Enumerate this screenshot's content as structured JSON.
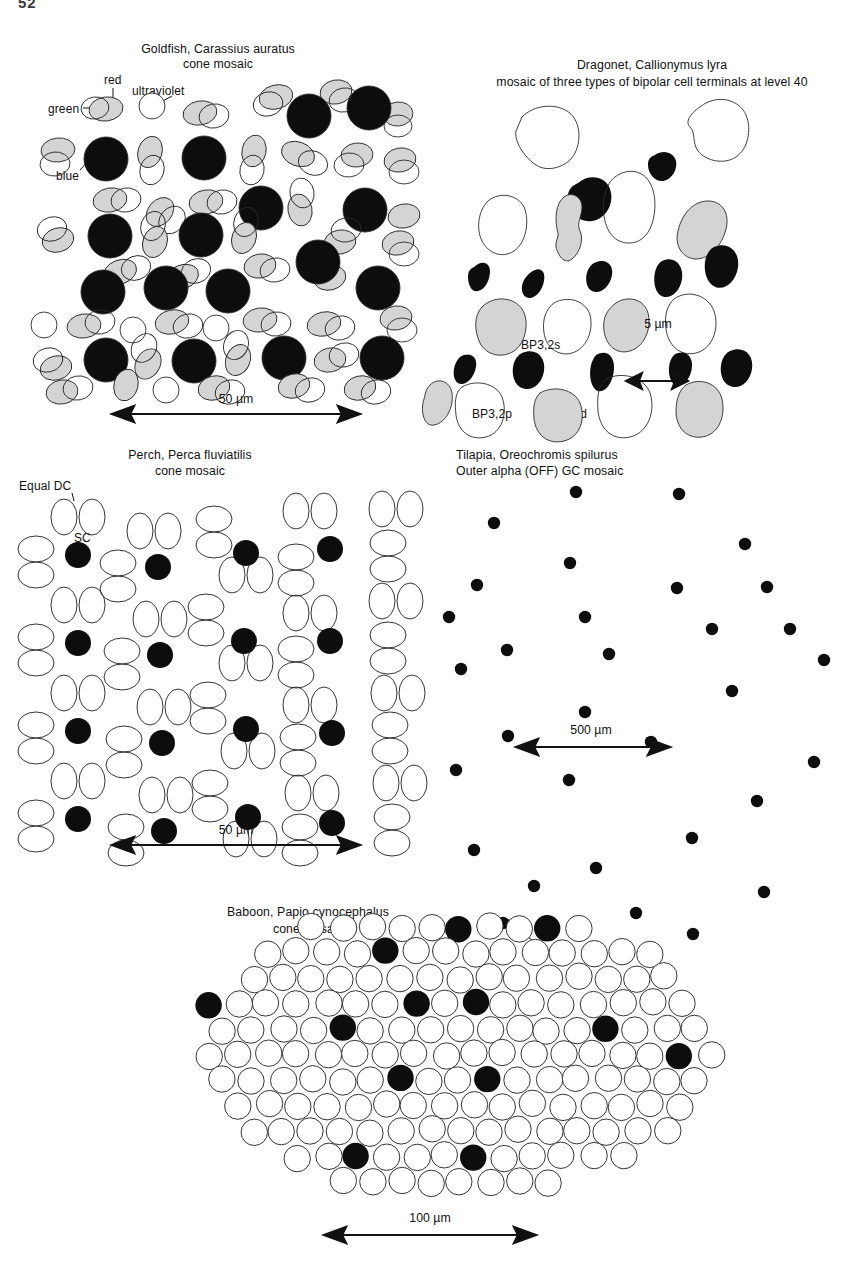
{
  "page": {
    "number": "52"
  },
  "figure": {
    "kind": "retinal-mosaic-comparison",
    "panel_count": 5
  },
  "panels": [
    {
      "id": "goldfish",
      "title_line1": "Goldfish, Carassius auratus",
      "title_line2": "cone mosaic",
      "title_align": "center",
      "labels": [
        {
          "name": "red",
          "text": "red"
        },
        {
          "name": "ultraviolet",
          "text": "ultraviolet"
        },
        {
          "name": "green",
          "text": "green"
        },
        {
          "name": "blue",
          "text": "blue"
        }
      ],
      "scale": {
        "text": "50 µm"
      },
      "legend_meaning": {
        "gray_ellipse": "red cone",
        "outline_ellipse": "green cone",
        "black_circle": "blue cone",
        "white_circle": "ultraviolet cone"
      }
    },
    {
      "id": "dragonet",
      "title_line1": "Dragonet, Callionymus lyra",
      "title_line2": "mosaic of three types of bipolar cell terminals at level 40",
      "title_align": "center",
      "labels": [
        {
          "name": "bp32s",
          "text": "BP3,2s"
        },
        {
          "name": "bp32p",
          "text": "BP3,2p"
        },
        {
          "name": "bp32d",
          "text": "BP3,2d"
        }
      ],
      "scale": {
        "text": "5 µm"
      },
      "legend_meaning": {
        "black_blob": "BP3,2s",
        "outline_blob": "BP3,2p",
        "gray_blob": "BP3,2d"
      }
    },
    {
      "id": "perch",
      "title_line1": "Perch, Perca fluviatilis",
      "title_line2": "cone mosaic",
      "title_align": "center",
      "labels": [
        {
          "name": "equal-dc",
          "text": "Equal DC"
        },
        {
          "name": "sc",
          "text": "SC"
        }
      ],
      "scale": {
        "text": "50 µm"
      },
      "legend_meaning": {
        "outline_ellipse_pair": "Equal DC (double cones)",
        "black_circle": "SC (single cone)"
      }
    },
    {
      "id": "tilapia",
      "title_line1": "Tilapia, Oreochromis spilurus",
      "title_line2": "Outer alpha (OFF) GC mosaic",
      "title_align": "left",
      "labels": [],
      "scale": {
        "text": "500 µm"
      },
      "legend_meaning": {
        "black_dot": "outer alpha (OFF) ganglion cell"
      }
    },
    {
      "id": "baboon",
      "title_line1": "Baboon, Papio cynocephalus",
      "title_line2": "cone mosaic",
      "title_align": "center",
      "labels": [
        {
          "name": "blue",
          "text": "blue"
        }
      ],
      "scale": {
        "text": "100 µm"
      },
      "legend_meaning": {
        "outline_circle": "red/green cone",
        "black_circle": "blue cone"
      }
    }
  ],
  "colors": {
    "ink": "#111111",
    "gray_fill": "#d4d4d4",
    "black_fill": "#0d0d0d",
    "white_fill": "#ffffff",
    "outline": "#2a2a2a"
  }
}
